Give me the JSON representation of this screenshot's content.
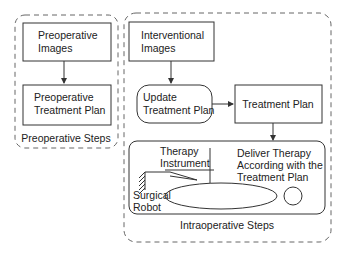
{
  "groups": {
    "preoperative": {
      "label": "Preoperative Steps"
    },
    "intraoperative": {
      "label": "Intraoperative Steps"
    }
  },
  "nodes": {
    "preop_images": {
      "line1": "Preoperative",
      "line2": "Images"
    },
    "preop_plan": {
      "line1": "Preoperative",
      "line2": "Treatment Plan"
    },
    "interv_images": {
      "line1": "Interventional",
      "line2": "Images"
    },
    "update_plan": {
      "line1": "Update",
      "line2": "Treatment Plan"
    },
    "treatment_plan": {
      "line1": "Treatment Plan"
    },
    "deliver": {
      "line1": "Deliver Therapy",
      "line2": "According with the",
      "line3": "Treatment Plan",
      "instrument_line1": "Therapy",
      "instrument_line2": "Instrument",
      "robot_line1": "Surgical",
      "robot_line2": "Robot"
    }
  },
  "colors": {
    "stroke": "#333333",
    "dashed": "#666666",
    "text": "#222222",
    "background": "#ffffff"
  }
}
